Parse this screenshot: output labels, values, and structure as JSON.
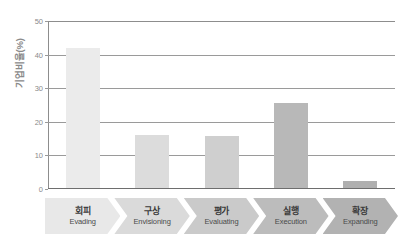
{
  "chart_data": {
    "type": "bar",
    "title": "",
    "subtitle": "",
    "xlabel": "",
    "ylabel": "기업비율(%)",
    "ylim": [
      0,
      50
    ],
    "yticks": [
      0,
      10,
      20,
      30,
      40,
      50
    ],
    "ytick_labels": [
      "0",
      "10",
      "20",
      "30",
      "40",
      "50"
    ],
    "grid": true,
    "grid_axis": "y",
    "legend": false,
    "legend_position": "none",
    "categories": [
      "회피",
      "구상",
      "평가",
      "실행",
      "확장"
    ],
    "categories_en": [
      "Evading",
      "Envisioning",
      "Evaluating",
      "Execution",
      "Expanding"
    ],
    "values": [
      42,
      16,
      15.7,
      25.5,
      2.5
    ],
    "bar_colors": [
      "#ebebeb",
      "#dcdcdc",
      "#cfcfcf",
      "#b8b8b8",
      "#b0b0b0"
    ],
    "chevron_colors": [
      "#e8e8e8",
      "#dadada",
      "#cacaca",
      "#bcbcbc",
      "#b2b2b2"
    ]
  },
  "axis": {
    "y_title": "기업비율(%)",
    "y_title_color": "#8a8a8a",
    "tick_color": "#8a8a8a",
    "grid_color": "#9a9a9a",
    "frame_color": "#8d8d8d",
    "baseline_color": "#6e6e6e"
  },
  "categories": [
    {
      "kr": "회피",
      "en": "Evading",
      "value": 42,
      "bar_color": "#ebebeb",
      "chevron_color": "#e8e8e8"
    },
    {
      "kr": "구상",
      "en": "Envisioning",
      "value": 16,
      "bar_color": "#dcdcdc",
      "chevron_color": "#dadada"
    },
    {
      "kr": "평가",
      "en": "Evaluating",
      "value": 15.7,
      "bar_color": "#cfcfcf",
      "chevron_color": "#cacaca"
    },
    {
      "kr": "실행",
      "en": "Execution",
      "value": 25.5,
      "bar_color": "#b8b8b8",
      "chevron_color": "#bcbcbc"
    },
    {
      "kr": "확장",
      "en": "Expanding",
      "value": 2.5,
      "bar_color": "#b0b0b0",
      "chevron_color": "#b2b2b2"
    }
  ]
}
